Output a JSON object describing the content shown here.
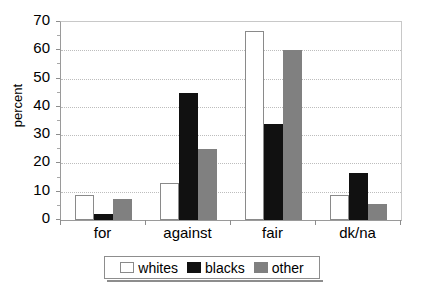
{
  "chart_data": {
    "type": "bar",
    "title": "",
    "xlabel": "",
    "ylabel": "percent",
    "categories": [
      "for",
      "against",
      "fair",
      "dk/na"
    ],
    "series": [
      {
        "name": "whites",
        "color": "#ffffff",
        "values": [
          9,
          13,
          67,
          9
        ]
      },
      {
        "name": "blacks",
        "color": "#111111",
        "values": [
          2,
          45,
          34,
          16.5
        ]
      },
      {
        "name": "other",
        "color": "#808080",
        "values": [
          7.5,
          25,
          60,
          5.5
        ]
      }
    ],
    "ylim": [
      0,
      70
    ],
    "y_ticks": [
      0,
      10,
      20,
      30,
      40,
      50,
      60,
      70
    ],
    "y_tick_labels": [
      "0",
      "10",
      "20",
      "30",
      "40",
      "50",
      "60",
      "70"
    ],
    "grid": true,
    "legend_position": "bottom"
  },
  "legend": {
    "entries": [
      {
        "label": "whites"
      },
      {
        "label": "blacks"
      },
      {
        "label": "other"
      }
    ]
  }
}
